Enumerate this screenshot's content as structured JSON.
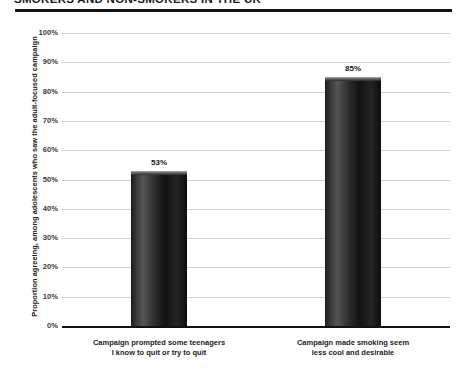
{
  "header": {
    "title": "SMOKERS AND NON-SMOKERS IN THE UK",
    "rule_color": "#111111"
  },
  "chart_data": {
    "type": "bar",
    "title": "",
    "xlabel": "",
    "ylabel": "Proportion agreeing, among adolescents who saw the adult-focused campaign",
    "categories": [
      "Campaign prompted some teenagers\nI know to quit or try to quit",
      "Campaign made smoking seem\nless cool and desirable"
    ],
    "category_lines": [
      [
        "Campaign prompted some teenagers",
        "I know to quit or try to quit"
      ],
      [
        "Campaign made smoking seem",
        "less cool and desirable"
      ]
    ],
    "values": [
      53,
      85
    ],
    "value_labels": [
      "53%",
      "85%"
    ],
    "ylim": [
      0,
      100
    ],
    "ytick_values": [
      0,
      10,
      20,
      30,
      40,
      50,
      60,
      70,
      80,
      90,
      100
    ],
    "ytick_labels": [
      "0%",
      "10%",
      "20%",
      "30%",
      "40%",
      "50%",
      "60%",
      "70%",
      "80%",
      "90%",
      "100%"
    ],
    "grid": true,
    "legend": "none",
    "bar_color": "#1b1b1b",
    "grid_color": "#d2d2d2",
    "axis_color": "#111111"
  }
}
